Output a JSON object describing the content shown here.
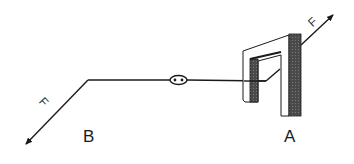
{
  "diagram": {
    "points": {
      "b": {
        "label": "B"
      },
      "a": {
        "label": "A"
      }
    },
    "forces": {
      "left": {
        "label": "F",
        "direction": "down-left"
      },
      "right": {
        "label": "F",
        "direction": "up-right"
      }
    },
    "components": {
      "wire": "horizontal wire",
      "connector": "oval connector",
      "frame": "U-shaped frame with shaded column"
    },
    "colors": {
      "stroke": "#1a1a1a",
      "shade": "#555555",
      "background": "#ffffff"
    }
  }
}
